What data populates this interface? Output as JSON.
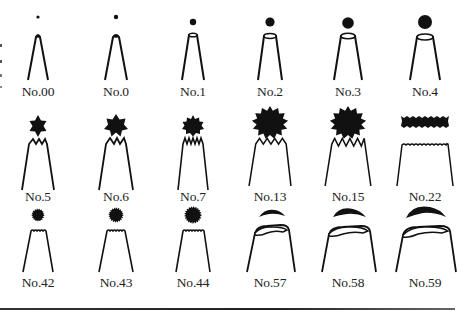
{
  "rows": [
    {
      "tips": [
        {
          "label": "No.00",
          "type": "round",
          "dot_r": 1.6
        },
        {
          "label": "No.0",
          "type": "round",
          "dot_r": 2.2
        },
        {
          "label": "No.1",
          "type": "round",
          "dot_r": 3.2
        },
        {
          "label": "No.2",
          "type": "round",
          "dot_r": 4.6
        },
        {
          "label": "No.3",
          "type": "round",
          "dot_r": 5.8
        },
        {
          "label": "No.4",
          "type": "round",
          "dot_r": 7.0
        }
      ]
    },
    {
      "tips": [
        {
          "label": "No.5",
          "type": "star",
          "points": 6,
          "outer": 7,
          "inner": 4
        },
        {
          "label": "No.6",
          "type": "star",
          "points": 7,
          "outer": 8.5,
          "inner": 5.5
        },
        {
          "label": "No.7",
          "type": "star",
          "points": 10,
          "outer": 8,
          "inner": 6
        },
        {
          "label": "No.13",
          "type": "star",
          "points": 12,
          "outer": 15,
          "inner": 11
        },
        {
          "label": "No.15",
          "type": "star",
          "points": 12,
          "outer": 15,
          "inner": 11
        },
        {
          "label": "No.22",
          "type": "ribbon"
        }
      ]
    },
    {
      "tips": [
        {
          "label": "No.42",
          "type": "fine-star",
          "r": 5.5
        },
        {
          "label": "No.43",
          "type": "fine-star",
          "r": 6.5
        },
        {
          "label": "No.44",
          "type": "fine-star",
          "r": 7.5
        },
        {
          "label": "No.57",
          "type": "petal",
          "size": 1.0
        },
        {
          "label": "No.58",
          "type": "petal",
          "size": 1.15
        },
        {
          "label": "No.59",
          "type": "petal",
          "size": 1.3
        }
      ]
    }
  ],
  "colors": {
    "ink": "#111111",
    "label": "#222222",
    "background": "#ffffff"
  }
}
